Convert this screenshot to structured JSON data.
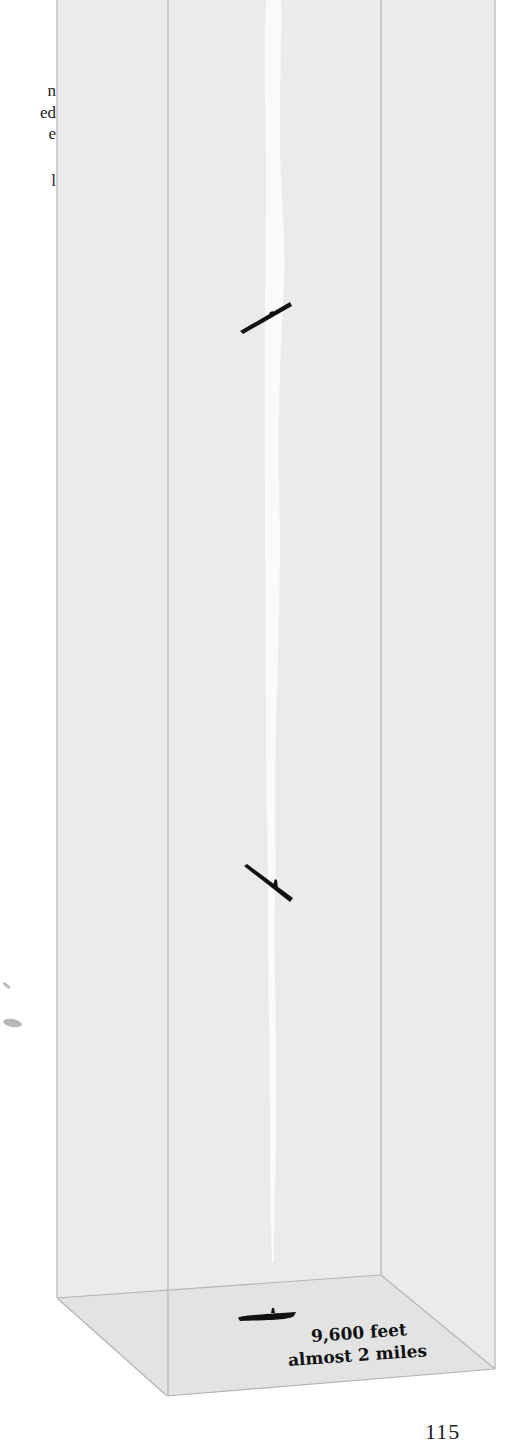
{
  "diagram": {
    "type": "3d-depth-column",
    "colors": {
      "column_fill": "#ebebeb",
      "floor_fill": "#e4e4e4",
      "edge_line": "#b4b4b4",
      "wake": "#fbfbfb",
      "submarine": "#111111"
    },
    "submarines": [
      {
        "label": "submarine-upper",
        "orientation": "rising"
      },
      {
        "label": "submarine-middle",
        "orientation": "diving"
      },
      {
        "label": "submarine-bottom",
        "orientation": "level"
      }
    ],
    "depth_label": {
      "line1": "9,600 feet",
      "line2": "almost 2 miles"
    }
  },
  "side_text_fragments": [
    "n",
    "ed",
    "e",
    "l"
  ],
  "page_number": "115"
}
